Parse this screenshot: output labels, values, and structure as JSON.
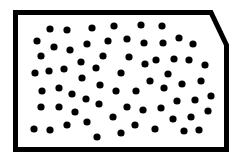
{
  "diagram": {
    "colors": {
      "background": "#ffffff",
      "stroke": "#000000",
      "dot": "#000000"
    },
    "border": {
      "stroke_width": 5,
      "points": [
        [
          15.5,
          12.5
        ],
        [
          211,
          12.5
        ],
        [
          226.5,
          45
        ],
        [
          226.5,
          149.5
        ],
        [
          15.5,
          149.5
        ]
      ]
    },
    "dot_radius": 3.6,
    "dot_count": 66,
    "dots": [
      [
        50,
        29
      ],
      [
        67,
        30
      ],
      [
        92,
        28
      ],
      [
        114,
        26
      ],
      [
        141,
        25
      ],
      [
        162,
        26
      ],
      [
        37,
        41
      ],
      [
        54,
        47
      ],
      [
        87,
        44
      ],
      [
        108,
        41
      ],
      [
        127,
        39
      ],
      [
        144,
        43
      ],
      [
        163,
        43
      ],
      [
        179,
        38
      ],
      [
        193,
        44
      ],
      [
        41,
        56
      ],
      [
        70,
        50
      ],
      [
        103,
        56
      ],
      [
        129,
        57
      ],
      [
        145,
        64
      ],
      [
        156,
        60
      ],
      [
        174,
        59
      ],
      [
        189,
        60
      ],
      [
        205,
        65
      ],
      [
        35,
        73
      ],
      [
        49,
        71
      ],
      [
        64,
        69
      ],
      [
        81,
        62
      ],
      [
        96,
        68
      ],
      [
        121,
        73
      ],
      [
        168,
        74
      ],
      [
        82,
        78
      ],
      [
        100,
        85
      ],
      [
        150,
        81
      ],
      [
        164,
        88
      ],
      [
        182,
        84
      ],
      [
        201,
        81
      ],
      [
        42,
        91
      ],
      [
        59,
        88
      ],
      [
        72,
        94
      ],
      [
        116,
        91
      ],
      [
        136,
        91
      ],
      [
        211,
        96
      ],
      [
        86,
        99
      ],
      [
        99,
        104
      ],
      [
        177,
        101
      ],
      [
        195,
        100
      ],
      [
        41,
        107
      ],
      [
        59,
        107
      ],
      [
        75,
        112
      ],
      [
        127,
        107
      ],
      [
        143,
        110
      ],
      [
        161,
        108
      ],
      [
        208,
        111
      ],
      [
        87,
        122
      ],
      [
        113,
        117
      ],
      [
        173,
        119
      ],
      [
        191,
        117
      ],
      [
        34,
        129
      ],
      [
        50,
        130
      ],
      [
        67,
        125
      ],
      [
        135,
        125
      ],
      [
        155,
        129
      ],
      [
        184,
        131
      ],
      [
        199,
        130
      ],
      [
        97,
        137
      ],
      [
        121,
        133
      ]
    ]
  }
}
